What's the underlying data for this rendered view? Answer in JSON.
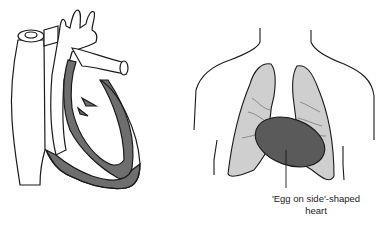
{
  "figure": {
    "left_panel": {
      "subject": "heart cross-section diagram"
    },
    "right_panel": {
      "subject": "chest outline with lungs and heart",
      "annotation": {
        "line1": "'Egg on side'-shaped",
        "line2": "heart"
      }
    },
    "colors": {
      "myocardium": "#6e6e6e",
      "lung_fill": "#cfcfcf",
      "heart_fill": "#5a5a5a",
      "outline": "#1a1a1a"
    }
  }
}
